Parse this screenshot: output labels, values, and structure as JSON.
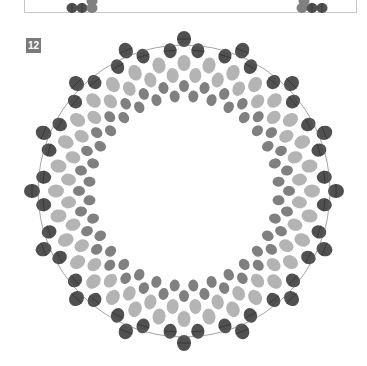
{
  "previous_step": {
    "left_beads": [
      {
        "x": 72,
        "y": 8,
        "shade": "dark"
      },
      {
        "x": 82,
        "y": 8,
        "shade": "dark"
      },
      {
        "x": 92,
        "y": 8,
        "shade": "medium"
      },
      {
        "x": 92,
        "y": 1,
        "shade": "medium"
      }
    ],
    "right_beads": [
      {
        "x": 302,
        "y": 8,
        "shade": "medium"
      },
      {
        "x": 312,
        "y": 8,
        "shade": "dark"
      },
      {
        "x": 322,
        "y": 8,
        "shade": "dark"
      },
      {
        "x": 304,
        "y": 1,
        "shade": "medium"
      }
    ]
  },
  "step": {
    "number": "12"
  },
  "ring": {
    "center": [
      184,
      191
    ],
    "points": 16,
    "rows": [
      {
        "radius": 152,
        "count": 16,
        "shade": "dark",
        "rx": 7,
        "ry": 8,
        "offset": 0
      },
      {
        "radius": 141,
        "count": 32,
        "shade": "dark",
        "rx": 6.5,
        "ry": 7.5,
        "offset": 0.5
      },
      {
        "radius": 128,
        "count": 32,
        "shade": "light",
        "rx": 6.5,
        "ry": 8,
        "offset": 0
      },
      {
        "radius": 116,
        "count": 32,
        "shade": "light",
        "rx": 6,
        "ry": 7.5,
        "offset": 0.5
      },
      {
        "radius": 105,
        "count": 32,
        "shade": "medium",
        "rx": 5,
        "ry": 6,
        "offset": 0
      },
      {
        "radius": 95,
        "count": 32,
        "shade": "medium",
        "rx": 5,
        "ry": 6,
        "offset": 0.5
      }
    ],
    "colors": {
      "dark": "#505050",
      "medium": "#808080",
      "light": "#b4b4b4",
      "thread": "#333333"
    }
  }
}
